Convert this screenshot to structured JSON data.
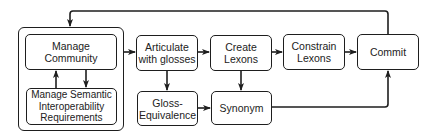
{
  "diagram": {
    "type": "flowchart",
    "nodes": {
      "manage_community": "Manage\nCommunity",
      "manage_requirements": "Manage Semantic\nInteroperability\nRequirements",
      "articulate": "Articulate\nwith glosses",
      "gloss_equivalence": "Gloss-\nEquivalence",
      "create_lexons": "Create\nLexons",
      "synonym": "Synonym",
      "constrain_lexons": "Constrain\nLexons",
      "commit": "Commit"
    },
    "edges": [
      {
        "from": "manage_community",
        "to": "manage_requirements"
      },
      {
        "from": "manage_requirements",
        "to": "manage_community"
      },
      {
        "from": "community_group",
        "to": "articulate"
      },
      {
        "from": "articulate",
        "to": "create_lexons"
      },
      {
        "from": "articulate",
        "to": "gloss_equivalence"
      },
      {
        "from": "create_lexons",
        "to": "constrain_lexons"
      },
      {
        "from": "create_lexons",
        "to": "synonym"
      },
      {
        "from": "gloss_equivalence",
        "to": "synonym"
      },
      {
        "from": "constrain_lexons",
        "to": "commit"
      },
      {
        "from": "synonym",
        "to": "commit"
      },
      {
        "from": "commit",
        "to": "community_group"
      }
    ],
    "colors": {
      "stroke": "#1e1e1e",
      "background": "#ffffff",
      "text": "#222222"
    }
  }
}
